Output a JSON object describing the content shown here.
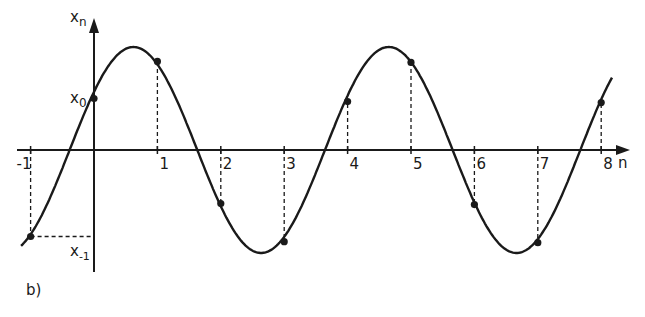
{
  "figure": {
    "panel_label": "b)",
    "y_axis_label": "x",
    "y_axis_label_sub": "n",
    "x_axis_label": "n",
    "marked_values": [
      {
        "label": "x",
        "sub": "0",
        "n": 0
      },
      {
        "label": "x",
        "sub": "-1",
        "n": -1
      }
    ]
  },
  "chart_data": {
    "type": "line",
    "title": "",
    "xlabel": "n",
    "ylabel": "x_n",
    "x_tick_labels": [
      "-1",
      "1",
      "2",
      "3",
      "4",
      "5",
      "6",
      "7",
      "8"
    ],
    "x_ticks": [
      -1,
      1,
      2,
      3,
      4,
      5,
      6,
      7,
      8
    ],
    "xlim": [
      -1.15,
      8.35
    ],
    "ylim": [
      -1.1,
      1.25
    ],
    "curve": {
      "description": "continuous sinusoid sampled at integer n",
      "amplitude": 1.0,
      "omega": 1.56,
      "phase": 0.6,
      "x_range": [
        -1.15,
        8.17
      ]
    },
    "samples": {
      "n": [
        -1,
        0,
        1,
        2,
        3,
        4,
        5,
        6,
        7,
        8
      ],
      "values": [
        -0.84,
        0.5,
        0.86,
        -0.52,
        -0.89,
        0.47,
        0.85,
        -0.53,
        -0.9,
        0.46
      ]
    },
    "grid": false,
    "legend": "none"
  }
}
